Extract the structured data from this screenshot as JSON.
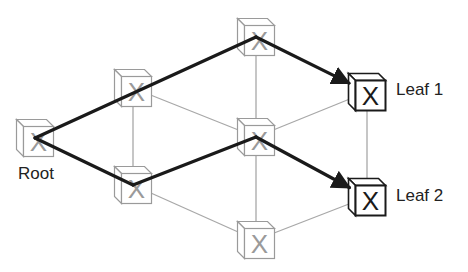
{
  "diagram": {
    "title": "",
    "colors": {
      "path": "#1a1a1a",
      "link": "#a8a8a8",
      "node_dim": "#9a9a9a",
      "node_leaf": "#1a1a1a"
    },
    "nodes": [
      {
        "id": "root",
        "x": 35,
        "y": 138,
        "kind": "dim",
        "label": "Root"
      },
      {
        "id": "n1",
        "x": 133,
        "y": 88,
        "kind": "dim",
        "label": ""
      },
      {
        "id": "n2",
        "x": 133,
        "y": 185,
        "kind": "dim",
        "label": ""
      },
      {
        "id": "n3",
        "x": 256,
        "y": 37,
        "kind": "dim",
        "label": ""
      },
      {
        "id": "n4",
        "x": 256,
        "y": 137,
        "kind": "dim",
        "label": ""
      },
      {
        "id": "n5",
        "x": 256,
        "y": 240,
        "kind": "dim",
        "label": ""
      },
      {
        "id": "leaf1",
        "x": 367,
        "y": 92,
        "kind": "leaf",
        "label": "Leaf 1"
      },
      {
        "id": "leaf2",
        "x": 367,
        "y": 197,
        "kind": "leaf",
        "label": "Leaf 2"
      }
    ],
    "links": [
      [
        "n1",
        "n2"
      ],
      [
        "n1",
        "n4"
      ],
      [
        "n2",
        "n5"
      ],
      [
        "n3",
        "n4"
      ],
      [
        "n4",
        "n5"
      ],
      [
        "n4",
        "leaf1"
      ],
      [
        "n5",
        "leaf2"
      ],
      [
        "leaf1",
        "leaf2"
      ]
    ],
    "paths": [
      [
        "root",
        "n3",
        "leaf1"
      ],
      [
        "root",
        "n2",
        "n4",
        "leaf2"
      ]
    ],
    "labels": {
      "root": "Root",
      "leaf1": "Leaf 1",
      "leaf2": "Leaf 2"
    },
    "node_glyph": "X"
  }
}
